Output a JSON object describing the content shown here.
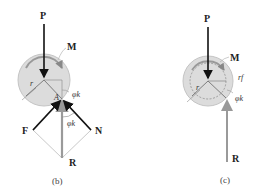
{
  "figures": {
    "b": {
      "caption": "(b)",
      "labels": {
        "P": "P",
        "M": "M",
        "r": "r",
        "A": "A",
        "phi_k_top": "φk",
        "phi_k_bottom": "φk",
        "F": "F",
        "N": "N",
        "R": "R"
      }
    },
    "c": {
      "caption": "(c)",
      "labels": {
        "P": "P",
        "M": "M",
        "r": "r",
        "r_f": "rf",
        "phi_k": "φk",
        "R": "R"
      }
    }
  },
  "colors": {
    "disk_fill": "#d9d9d9",
    "disk_stroke": "#bdbdbd",
    "force_dark": "#111111",
    "force_gray": "#9a9a9a",
    "construction": "#bbbbbb"
  }
}
